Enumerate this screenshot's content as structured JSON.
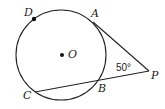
{
  "diagram": {
    "type": "geometry",
    "circle": {
      "center_label": "O",
      "cx": 61,
      "cy": 55,
      "r": 45
    },
    "points": {
      "D": {
        "label": "D",
        "x": 34,
        "y": 19
      },
      "A": {
        "label": "A",
        "x": 93,
        "y": 22
      },
      "O": {
        "label": "O",
        "x": 62,
        "y": 55
      },
      "P": {
        "label": "P",
        "x": 149,
        "y": 71
      },
      "B": {
        "label": "B",
        "x": 98,
        "y": 81
      },
      "C": {
        "label": "C",
        "x": 35,
        "y": 92
      }
    },
    "segments": [
      {
        "from": "A",
        "to": "P",
        "kind": "tangent"
      },
      {
        "from": "C",
        "to": "P",
        "kind": "secant"
      }
    ],
    "angle": {
      "vertex": "P",
      "label": "50°"
    }
  }
}
